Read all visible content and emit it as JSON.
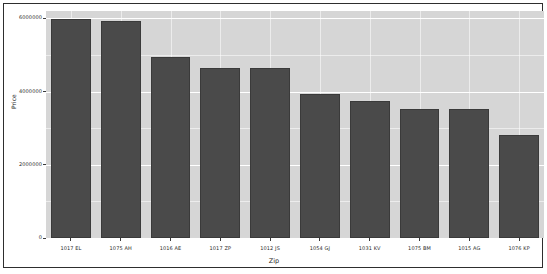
{
  "chart_data": {
    "type": "bar",
    "title": "",
    "xlabel": "Zip",
    "ylabel": "Price",
    "categories": [
      "1017 EL",
      "1075 AH",
      "1016 AE",
      "1017 ZP",
      "1012 JS",
      "1054 GJ",
      "1031 KV",
      "1075 BM",
      "1015 AG",
      "1076 KP"
    ],
    "values": [
      5975000,
      5915000,
      4940000,
      4635000,
      4635000,
      3935000,
      3740000,
      3515000,
      3515000,
      2820000
    ],
    "ylim": [
      0,
      6200000
    ],
    "yticks": [
      0,
      2000000,
      4000000,
      6000000
    ],
    "ytick_labels": [
      "0",
      "2000000",
      "4000000",
      "6000000"
    ],
    "grid": true,
    "legend": "none",
    "bar_color": "#4a4a4a",
    "panel_color": "#d6d6d6",
    "grid_color": "#ffffff"
  },
  "axes": {
    "y_title": "Price",
    "x_title": "Zip"
  }
}
